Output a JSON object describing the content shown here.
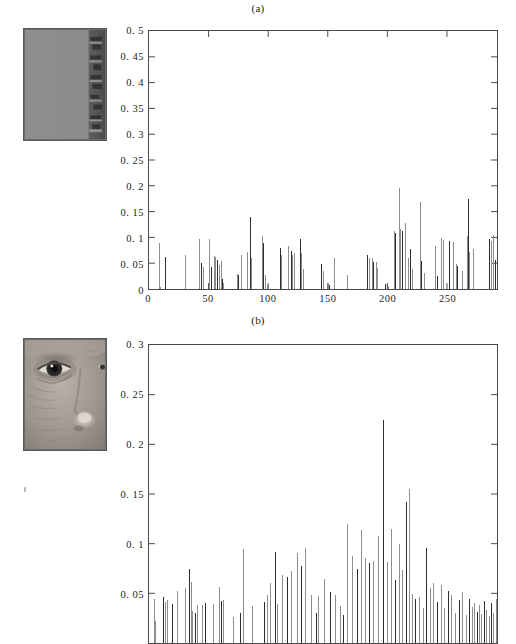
{
  "figure": {
    "panels": [
      {
        "id": "a",
        "label": "(a)",
        "thumbnail_name": "flat-gray-patch-thumbnail",
        "thumbnail_description": "uniform gray image patch with dark textured strip on right edge"
      },
      {
        "id": "b",
        "label": "(b)",
        "thumbnail_name": "face-eye-region-thumbnail",
        "thumbnail_description": "grayscale close-up of a human eye and side of nose"
      }
    ]
  },
  "chart_data": [
    {
      "type": "bar",
      "title": "(a)",
      "xlabel": "",
      "ylabel": "",
      "xlim": [
        0,
        292
      ],
      "ylim": [
        0,
        0.5
      ],
      "grid": false,
      "legend": null,
      "ytick_labels": [
        "0",
        "0. 05",
        "0. 1",
        "0. 15",
        "0. 2",
        "0. 25",
        "0. 3",
        "0. 35",
        "0. 4",
        "0. 45",
        "0. 5"
      ],
      "ytick_values": [
        0,
        0.05,
        0.1,
        0.15,
        0.2,
        0.25,
        0.3,
        0.35,
        0.4,
        0.45,
        0.5
      ],
      "xtick_labels": [
        "0",
        "50",
        "100",
        "150",
        "200",
        "250"
      ],
      "xtick_values": [
        0,
        50,
        100,
        150,
        200,
        250
      ],
      "x": [
        8,
        9,
        13,
        30,
        42,
        43,
        45,
        50,
        52,
        54,
        55,
        57,
        58,
        60,
        61,
        62,
        74,
        75,
        78,
        83,
        85,
        86,
        95,
        96,
        98,
        99,
        110,
        111,
        117,
        119,
        120,
        122,
        127,
        128,
        129,
        144,
        146,
        150,
        151,
        155,
        166,
        183,
        184,
        187,
        188,
        190,
        191,
        198,
        200,
        205,
        206,
        209,
        210,
        212,
        214,
        217,
        219,
        221,
        228,
        229,
        231,
        240,
        242,
        245,
        247,
        252,
        255,
        258,
        259,
        263,
        267,
        268,
        269,
        272,
        285,
        287,
        289,
        290
      ],
      "y": [
        0.089,
        0.004,
        0.062,
        0.065,
        0.097,
        0.05,
        0.042,
        0.097,
        0.042,
        0.063,
        0.062,
        0.057,
        0.046,
        0.055,
        0.02,
        0.012,
        0.029,
        0.027,
        0.066,
        0.072,
        0.139,
        0.06,
        0.103,
        0.09,
        0.027,
        0.008,
        0.08,
        0.066,
        0.084,
        0.073,
        0.066,
        0.07,
        0.096,
        0.069,
        0.038,
        0.049,
        0.035,
        0.011,
        0.007,
        0.061,
        0.028,
        0.065,
        0.061,
        0.06,
        0.053,
        0.053,
        0.041,
        0.01,
        0.006,
        0.112,
        0.108,
        0.196,
        0.117,
        0.112,
        0.127,
        0.061,
        0.077,
        0.039,
        0.169,
        0.054,
        0.031,
        0.083,
        0.025,
        0.099,
        0.095,
        0.093,
        0.092,
        0.048,
        0.045,
        0.035,
        0.103,
        0.175,
        0.071,
        0.078,
        0.096,
        0.093,
        0.104,
        0.056
      ]
    },
    {
      "type": "bar",
      "title": "(b)",
      "xlabel": "",
      "ylabel": "",
      "xlim": [
        0,
        292
      ],
      "ylim": [
        0,
        0.3
      ],
      "grid": false,
      "legend": null,
      "cropped": "x-axis cut off at bottom of image",
      "ytick_labels": [
        "0. 05",
        "0. 1",
        "0. 15",
        "0. 2",
        "0. 25",
        "0. 3"
      ],
      "ytick_values": [
        0.05,
        0.1,
        0.15,
        0.2,
        0.25,
        0.3
      ],
      "xtick_labels": [],
      "xtick_values": [],
      "x": [
        4,
        5,
        12,
        13,
        15,
        19,
        23,
        30,
        33,
        35,
        36,
        38,
        40,
        44,
        47,
        53,
        58,
        60,
        62,
        70,
        77,
        79,
        87,
        97,
        99,
        102,
        106,
        108,
        112,
        116,
        119,
        124,
        128,
        131,
        136,
        140,
        142,
        147,
        152,
        156,
        160,
        163,
        166,
        170,
        174,
        178,
        181,
        184,
        188,
        192,
        196,
        199,
        203,
        206,
        209,
        212,
        215,
        218,
        221,
        224,
        227,
        230,
        233,
        236,
        239,
        242,
        245,
        248,
        251,
        254,
        257,
        260,
        263,
        266,
        269,
        271,
        273,
        275,
        277,
        279,
        281,
        283,
        285,
        287,
        289,
        291
      ],
      "y": [
        0.044,
        0.022,
        0.046,
        0.041,
        0.043,
        0.039,
        0.052,
        0.055,
        0.075,
        0.061,
        0.032,
        0.03,
        0.038,
        0.038,
        0.04,
        0.039,
        0.056,
        0.042,
        0.043,
        0.026,
        0.03,
        0.095,
        0.037,
        0.041,
        0.048,
        0.06,
        0.092,
        0.039,
        0.068,
        0.066,
        0.072,
        0.091,
        0.078,
        0.096,
        0.048,
        0.03,
        0.047,
        0.064,
        0.051,
        0.048,
        0.037,
        0.028,
        0.12,
        0.088,
        0.074,
        0.114,
        0.086,
        0.081,
        0.083,
        0.108,
        0.225,
        0.082,
        0.115,
        0.063,
        0.1,
        0.073,
        0.142,
        0.155,
        0.049,
        0.044,
        0.046,
        0.035,
        0.096,
        0.055,
        0.06,
        0.041,
        0.058,
        0.035,
        0.052,
        0.048,
        0.03,
        0.043,
        0.051,
        0.028,
        0.044,
        0.036,
        0.04,
        0.031,
        0.038,
        0.029,
        0.042,
        0.033,
        0.027,
        0.04,
        0.03,
        0.044
      ]
    }
  ],
  "colors": {
    "axis": "#4a4a4a",
    "stem_light": "#8c8c8c",
    "stem_dark": "#2b2b2b",
    "text": "#1c1c1c",
    "background": "#ffffff"
  }
}
